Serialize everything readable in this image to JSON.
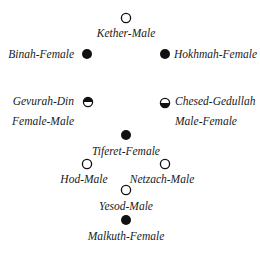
{
  "diagram": {
    "colors": {
      "filled": "#111111",
      "empty": "#ffffff",
      "stroke": "#111111"
    },
    "nodes": [
      {
        "id": "kether",
        "label": "Kether-Male",
        "fill": "empty"
      },
      {
        "id": "binah",
        "label": "Binah-Female",
        "fill": "filled"
      },
      {
        "id": "hokhmah",
        "label": "Hokhmah-Female",
        "fill": "filled"
      },
      {
        "id": "gevurah",
        "label_line1": "Gevurah-Din",
        "label_line2": "Female-Male",
        "fill": "half-top-filled"
      },
      {
        "id": "chesed",
        "label_line1": "Chesed-Gedullah",
        "label_line2": "Male-Female",
        "fill": "half-bottom-filled"
      },
      {
        "id": "tiferet",
        "label": "Tiferet-Female",
        "fill": "filled"
      },
      {
        "id": "hod",
        "label": "Hod-Male",
        "fill": "empty"
      },
      {
        "id": "netzach",
        "label": "Netzach-Male",
        "fill": "empty"
      },
      {
        "id": "yesod",
        "label": "Yesod-Male",
        "fill": "empty"
      },
      {
        "id": "malkuth",
        "label": "Malkuth-Female",
        "fill": "filled"
      }
    ]
  }
}
